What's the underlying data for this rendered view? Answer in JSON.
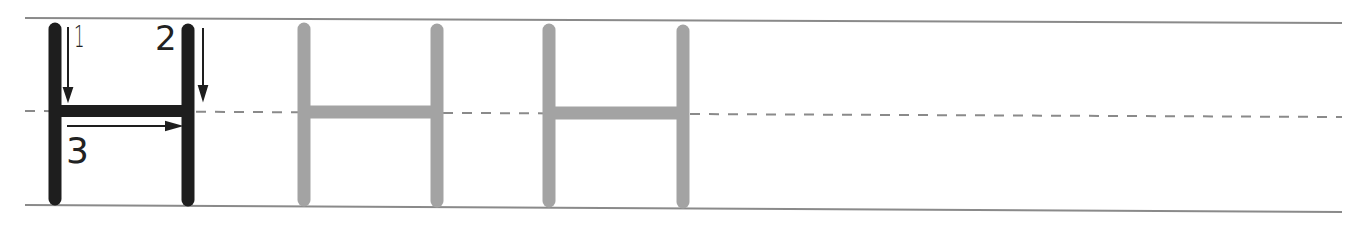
{
  "worksheet": {
    "letter": "H",
    "stroke_numbers": [
      "1",
      "2",
      "3"
    ],
    "traced_letters_count": 2,
    "colors": {
      "model_letter": "#1e1e1e",
      "trace_letter": "#a3a3a3",
      "guide_lines": "#8a8a8a",
      "midline_dash": "#8a8a8a"
    }
  }
}
